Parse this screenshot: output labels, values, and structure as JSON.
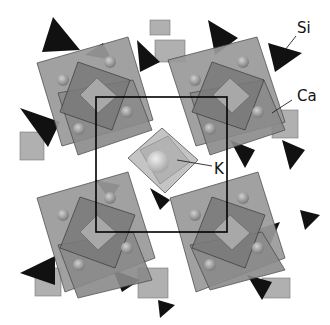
{
  "diagram": {
    "type": "crystal-structure-polyhedral",
    "labels": {
      "si": "Si",
      "ca": "Ca",
      "k": "K"
    },
    "colors": {
      "si_tetrahedron": "#111111",
      "ca_polyhedron": "#8c8c8c",
      "ca_polyhedron_dark": "#6e6e6e",
      "ca_atom": "#9a9a9a",
      "k_polyhedron": "#b9b9b9",
      "unit_cell_line": "#000000",
      "background": "#ffffff"
    }
  }
}
